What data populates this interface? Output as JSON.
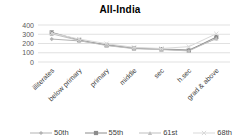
{
  "chart_data": {
    "type": "line",
    "title": "All-India",
    "categories": [
      "illiterates",
      "below primary",
      "primary",
      "middle",
      "sec",
      "h.sec",
      "grad & above"
    ],
    "series": [
      {
        "name": "50th",
        "marker": "diamond",
        "color": "#b3b3b3",
        "values": [
          248,
          228,
          188,
          152,
          140,
          132,
          252
        ]
      },
      {
        "name": "55th",
        "marker": "square",
        "color": "#8c8c8c",
        "values": [
          320,
          238,
          182,
          148,
          138,
          124,
          270
        ]
      },
      {
        "name": "61st",
        "marker": "triangle",
        "color": "#bfbfbf",
        "values": [
          305,
          232,
          178,
          144,
          134,
          120,
          256
        ]
      },
      {
        "name": "68th",
        "marker": "x",
        "color": "#d9d9d9",
        "values": [
          312,
          248,
          198,
          158,
          146,
          166,
          305
        ]
      }
    ],
    "xlabel": "",
    "ylabel": "",
    "ylim": [
      0,
      400
    ],
    "yticks": [
      0,
      100,
      200,
      300,
      400
    ],
    "grid": true,
    "legend_position": "bottom"
  },
  "colors": {
    "background": "#ffffff",
    "gridline": "#d9d9d9",
    "tick_text": "#595959",
    "label_text": "#404040",
    "title_text": "#1a1a1a"
  }
}
